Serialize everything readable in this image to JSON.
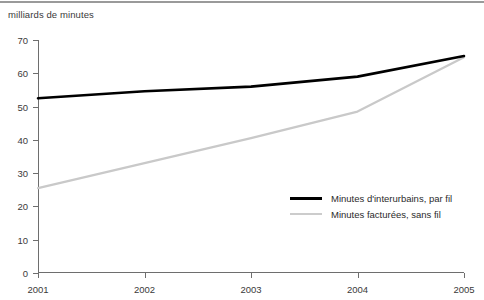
{
  "figure": {
    "axis_title": "milliards de minutes",
    "top_rule_color": "#9a9a9a"
  },
  "chart_data": {
    "type": "line",
    "title": "",
    "subtitle": "",
    "xlabel": "",
    "ylabel": "milliards de minutes",
    "x": [
      2001,
      2002,
      2003,
      2004,
      2005
    ],
    "categories": [
      "2001",
      "2002",
      "2003",
      "2004",
      "2005"
    ],
    "xtick_labels": [
      "2001",
      "2002",
      "2003",
      "2004",
      "2005"
    ],
    "ytick_labels": [
      "0",
      "10",
      "20",
      "30",
      "40",
      "50",
      "60",
      "70"
    ],
    "yticks": [
      0,
      10,
      20,
      30,
      40,
      50,
      60,
      70
    ],
    "ylim": [
      0,
      70
    ],
    "xlim": [
      2001,
      2005
    ],
    "grid": false,
    "legend_position": "inside-lower-right",
    "series": [
      {
        "name": "Minutes d'interurbains, par fil",
        "color": "#000000",
        "width": 2.6,
        "values": [
          52.5,
          54.6,
          56.0,
          59.0,
          65.2
        ]
      },
      {
        "name": "Minutes facturées, sans fil",
        "color": "#c9c9c9",
        "width": 2.2,
        "values": [
          25.5,
          33.0,
          40.5,
          48.5,
          64.8
        ]
      }
    ]
  },
  "legend": {
    "items": [
      {
        "label": "Minutes d'interurbains, par fil",
        "color": "#000000",
        "thickness": "3px"
      },
      {
        "label": "Minutes facturées, sans fil",
        "color": "#cccccc",
        "thickness": "2px"
      }
    ]
  }
}
